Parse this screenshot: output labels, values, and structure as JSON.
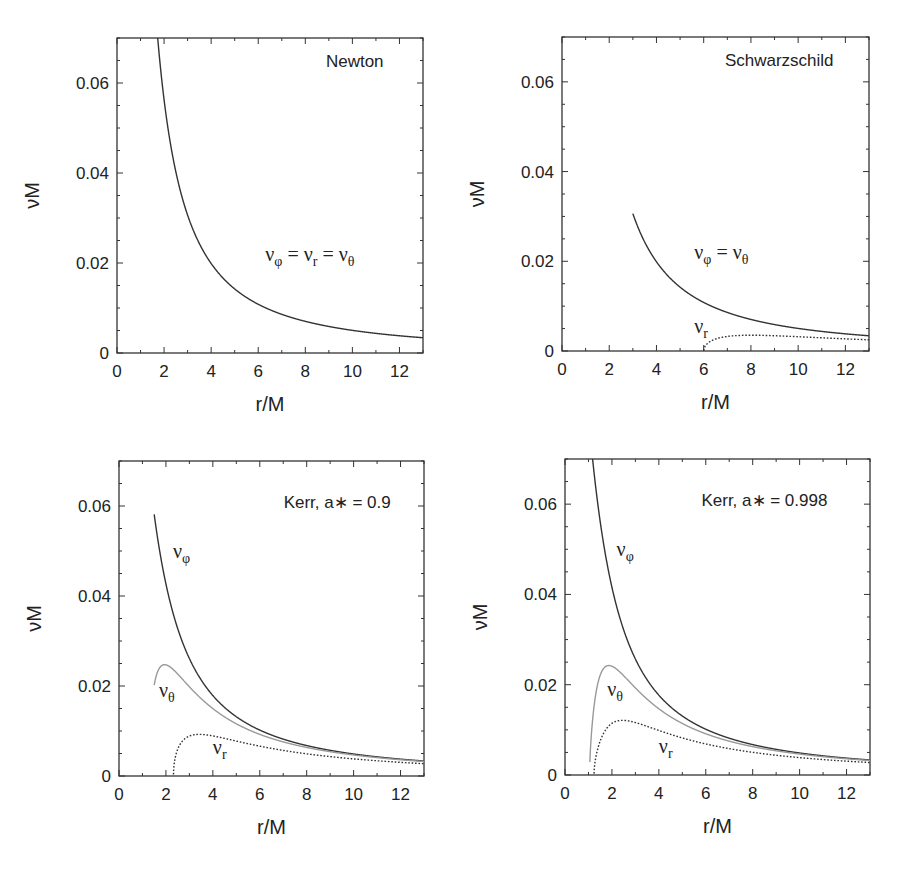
{
  "figure": {
    "xlabel": "r/M",
    "ylabel": "νM",
    "x_ticks": [
      "0",
      "2",
      "4",
      "6",
      "8",
      "10",
      "12"
    ],
    "y_ticks": [
      "0",
      "0.02",
      "0.04",
      "0.06"
    ]
  },
  "chart_data": [
    {
      "type": "line",
      "title": "Newton",
      "xlabel": "r/M",
      "ylabel": "νM",
      "xlim": [
        0,
        13
      ],
      "ylim": [
        0,
        0.07
      ],
      "grid": false,
      "spin": null,
      "series": [
        {
          "name": "νφ = νr = νθ",
          "style": "solid",
          "color": "#333333",
          "x": [
            1.6,
            2,
            3,
            4,
            5,
            6,
            8,
            10,
            13
          ],
          "y": [
            0.0786,
            0.0563,
            0.0306,
            0.0199,
            0.0142,
            0.0108,
            0.007,
            0.005,
            0.0034
          ]
        }
      ],
      "annotations": [
        {
          "text": "νφ = νr = νθ",
          "x": 6.3,
          "y": 0.021
        }
      ]
    },
    {
      "type": "line",
      "title": "Schwarzschild",
      "xlabel": "r/M",
      "ylabel": "νM",
      "xlim": [
        0,
        13
      ],
      "ylim": [
        0,
        0.07
      ],
      "grid": false,
      "spin": 0,
      "series": [
        {
          "name": "νφ = νθ",
          "style": "solid",
          "color": "#333333",
          "x": [
            3,
            4,
            5,
            6,
            8,
            10,
            13
          ],
          "y": [
            0.0306,
            0.0199,
            0.0142,
            0.0108,
            0.007,
            0.005,
            0.0034
          ]
        },
        {
          "name": "νr",
          "style": "dotted",
          "color": "#333333",
          "x": [
            6,
            6.5,
            7,
            8,
            9,
            10,
            13
          ],
          "y": [
            0,
            0.003,
            0.0034,
            0.0035,
            0.0034,
            0.0032,
            0.0026
          ]
        }
      ],
      "annotations": [
        {
          "text": "νφ = νθ",
          "x": 5.6,
          "y": 0.024
        },
        {
          "text": "νr",
          "x": 5.7,
          "y": 0.003
        }
      ]
    },
    {
      "type": "line",
      "title": "Kerr, a∗ = 0.9",
      "xlabel": "r/M",
      "ylabel": "νM",
      "xlim": [
        0,
        13
      ],
      "ylim": [
        0,
        0.07
      ],
      "grid": false,
      "spin": 0.9,
      "series": [
        {
          "name": "νφ",
          "style": "solid",
          "color": "#333333",
          "x": [
            1.5,
            2,
            3,
            4,
            6,
            8,
            10,
            13
          ],
          "y": [
            0.0556,
            0.0386,
            0.0232,
            0.016,
            0.0092,
            0.0061,
            0.0045,
            0.0032
          ]
        },
        {
          "name": "νθ",
          "style": "solid",
          "color": "#999999",
          "x": [
            1.5,
            1.9,
            2.5,
            3,
            4,
            6,
            8,
            10,
            13
          ],
          "y": [
            0.022,
            0.0245,
            0.0214,
            0.0183,
            0.0137,
            0.0085,
            0.0058,
            0.0043,
            0.0031
          ]
        },
        {
          "name": "νr",
          "style": "dotted",
          "color": "#333333",
          "x": [
            2.32,
            2.5,
            3,
            3.5,
            4,
            6,
            8,
            10,
            13
          ],
          "y": [
            0,
            0.006,
            0.009,
            0.0093,
            0.009,
            0.0072,
            0.0054,
            0.0041,
            0.003
          ]
        }
      ],
      "annotations": [
        {
          "text": "νφ",
          "x": 2.3,
          "y": 0.049
        },
        {
          "text": "νθ",
          "x": 2.0,
          "y": 0.018
        },
        {
          "text": "νr",
          "x": 4.3,
          "y": 0.005
        }
      ]
    },
    {
      "type": "line",
      "title": "Kerr, a∗ = 0.998",
      "xlabel": "r/M",
      "ylabel": "νM",
      "xlim": [
        0,
        13
      ],
      "ylim": [
        0,
        0.07
      ],
      "grid": false,
      "spin": 0.998,
      "series": [
        {
          "name": "νφ",
          "style": "solid",
          "color": "#333333",
          "x": [
            1.1,
            1.5,
            2,
            3,
            4,
            6,
            8,
            10,
            13
          ],
          "y": [
            0.0792,
            0.0568,
            0.0382,
            0.0225,
            0.0155,
            0.009,
            0.006,
            0.0044,
            0.0032
          ]
        },
        {
          "name": "νθ",
          "style": "solid",
          "color": "#999999",
          "x": [
            1.05,
            1.3,
            1.8,
            2.5,
            3,
            4,
            6,
            8,
            10,
            13
          ],
          "y": [
            0.006,
            0.019,
            0.0243,
            0.021,
            0.0178,
            0.0132,
            0.0082,
            0.0056,
            0.0042,
            0.003
          ]
        },
        {
          "name": "νr",
          "style": "dotted",
          "color": "#333333",
          "x": [
            1.24,
            1.5,
            2,
            2.5,
            3,
            4,
            6,
            8,
            10,
            13
          ],
          "y": [
            0,
            0.0085,
            0.0114,
            0.0118,
            0.0113,
            0.0097,
            0.007,
            0.0053,
            0.0041,
            0.003
          ]
        }
      ],
      "annotations": [
        {
          "text": "νφ",
          "x": 2.3,
          "y": 0.049
        },
        {
          "text": "νθ",
          "x": 1.9,
          "y": 0.018
        },
        {
          "text": "νr",
          "x": 4.3,
          "y": 0.005
        }
      ]
    }
  ],
  "panels": [
    {
      "title": "Newton",
      "frame": [
        117,
        38,
        423,
        353
      ],
      "title_pos": [
        10.1,
        0.0635
      ],
      "labels": [
        {
          "base": "ν",
          "sub": "φ",
          "mid": " = ν",
          "sub2": "r",
          "tail": " = ν",
          "sub3": "θ",
          "x": 6.3,
          "y": 0.0205
        }
      ]
    },
    {
      "title": "Schwarzschild",
      "frame": [
        562,
        37,
        869,
        351
      ],
      "title_pos": [
        9.2,
        0.0635
      ],
      "labels": [
        {
          "base": "ν",
          "sub": "φ",
          "mid": " = ν",
          "sub2": "θ",
          "x": 5.6,
          "y": 0.0205
        },
        {
          "base": "ν",
          "sub": "r",
          "x": 5.6,
          "y": 0.004
        }
      ]
    },
    {
      "title": "Kerr, a∗ = 0.9",
      "frame": [
        119,
        461,
        424,
        776
      ],
      "title_pos": [
        9.3,
        0.0595
      ],
      "labels": [
        {
          "base": "ν",
          "sub": "φ",
          "x": 2.3,
          "y": 0.0485
        },
        {
          "base": "ν",
          "sub": "θ",
          "x": 1.7,
          "y": 0.0175
        },
        {
          "base": "ν",
          "sub": "r",
          "x": 4.0,
          "y": 0.0048
        }
      ]
    },
    {
      "title": "Kerr, a∗ = 0.998",
      "frame": [
        565,
        459,
        870,
        775
      ],
      "title_pos": [
        8.5,
        0.0595
      ],
      "labels": [
        {
          "base": "ν",
          "sub": "φ",
          "x": 2.2,
          "y": 0.0485
        },
        {
          "base": "ν",
          "sub": "θ",
          "x": 1.8,
          "y": 0.0175
        },
        {
          "base": "ν",
          "sub": "r",
          "x": 4.0,
          "y": 0.0048
        }
      ]
    }
  ]
}
